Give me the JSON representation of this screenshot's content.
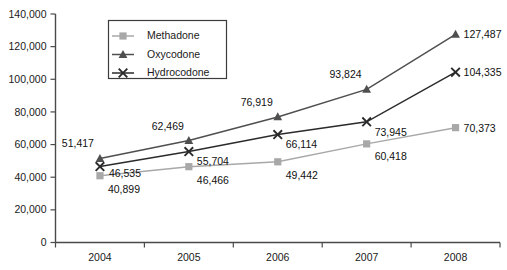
{
  "chart_data": {
    "type": "line",
    "title": "",
    "subtitle": "",
    "xlabel": "",
    "ylabel": "",
    "categories": [
      "2004",
      "2005",
      "2006",
      "2007",
      "2008"
    ],
    "ylim": [
      0,
      140000
    ],
    "yticks": [
      0,
      20000,
      40000,
      60000,
      80000,
      100000,
      120000,
      140000
    ],
    "ytick_labels": [
      "0",
      "20,000",
      "40,000",
      "60,000",
      "80,000",
      "100,000",
      "120,000",
      "140,000"
    ],
    "grid": false,
    "legend_position": "top-left-inside",
    "series": [
      {
        "name": "Methadone",
        "color": "#a8a8a8",
        "marker": "square",
        "values": [
          40899,
          46466,
          49442,
          60418,
          70373
        ],
        "labels": [
          "40,899",
          "46,466",
          "49,442",
          "60,418",
          "70,373"
        ]
      },
      {
        "name": "Oxycodone",
        "color": "#4f4f4f",
        "marker": "triangle",
        "values": [
          51417,
          62469,
          76919,
          93824,
          127487
        ],
        "labels": [
          "51,417",
          "62,469",
          "76,919",
          "93,824",
          "127,487"
        ]
      },
      {
        "name": "Hydrocodone",
        "color": "#2b2b2b",
        "marker": "cross",
        "values": [
          46535,
          55704,
          66114,
          73945,
          104335
        ],
        "labels": [
          "46,535",
          "55,704",
          "66,114",
          "73,945",
          "104,335"
        ]
      }
    ]
  },
  "legend": {
    "items": [
      {
        "label": "Methadone"
      },
      {
        "label": "Oxycodone"
      },
      {
        "label": "Hydrocodone"
      }
    ]
  }
}
